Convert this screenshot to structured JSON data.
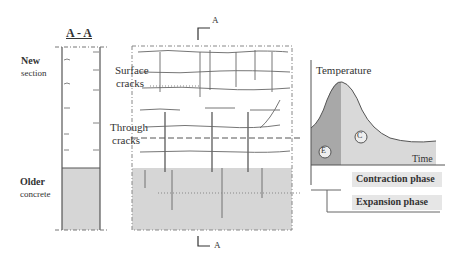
{
  "section_view": {
    "title": "A - A",
    "new_label_bold": "New",
    "new_label": "section",
    "older_label_bold": "Older",
    "older_label": "concrete"
  },
  "plan_view": {
    "surface_cracks": [
      "Surface",
      "cracks"
    ],
    "through_cracks": [
      "Through",
      "cracks"
    ],
    "cut_marker_top": "A",
    "cut_marker_bottom": "A"
  },
  "temperature_chart": {
    "y_axis_label": "Temperature",
    "x_axis_label": "Time",
    "marker_e": "E",
    "marker_c": "C",
    "phase_1": "Contraction phase",
    "phase_2": "Expansion phase"
  },
  "colors": {
    "line": "#555555",
    "fill_light": "#d9d9d9",
    "fill_dark": "#a6a6a6",
    "text": "#333333"
  }
}
